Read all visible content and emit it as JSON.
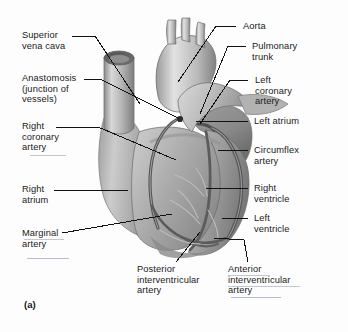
{
  "figure": {
    "panel_letter": "(a)",
    "background_color": "#fdfdfd",
    "ink_color": "#1a1a1a"
  },
  "labels": {
    "left": [
      {
        "id": "superior-vena-cava",
        "lines": [
          "Superior",
          "vena cava"
        ]
      },
      {
        "id": "anastomosis",
        "lines": [
          "Anastomosis",
          "(junction of",
          "vessels)"
        ]
      },
      {
        "id": "right-coronary-artery",
        "lines": [
          "Right",
          "coronary",
          "artery"
        ]
      },
      {
        "id": "right-atrium",
        "lines": [
          "Right",
          "atrium"
        ]
      },
      {
        "id": "marginal-artery",
        "lines": [
          "Marginal",
          "artery"
        ]
      }
    ],
    "right": [
      {
        "id": "aorta",
        "lines": [
          "Aorta"
        ]
      },
      {
        "id": "pulmonary-trunk",
        "lines": [
          "Pulmonary",
          "trunk"
        ]
      },
      {
        "id": "left-coronary-artery",
        "lines": [
          "Left",
          "coronary",
          "artery"
        ]
      },
      {
        "id": "left-atrium",
        "lines": [
          "Left atrium"
        ]
      },
      {
        "id": "circumflex-artery",
        "lines": [
          "Circumflex",
          "artery"
        ]
      },
      {
        "id": "right-ventricle",
        "lines": [
          "Right",
          "ventricle"
        ]
      },
      {
        "id": "left-ventricle",
        "lines": [
          "Left",
          "ventricle"
        ]
      }
    ],
    "bottom": [
      {
        "id": "posterior-interventricular-artery",
        "lines": [
          "Posterior",
          "interventricular",
          "artery"
        ]
      },
      {
        "id": "anterior-interventricular-artery",
        "lines": [
          "Anterior",
          "interventricular",
          "artery"
        ]
      }
    ]
  },
  "text": {
    "superior_vena_cava_l1": "Superior",
    "superior_vena_cava_l2": "vena cava",
    "anastomosis_l1": "Anastomosis",
    "anastomosis_l2": "(junction of",
    "anastomosis_l3": "vessels)",
    "right_coronary_l1": "Right",
    "right_coronary_l2": "coronary",
    "right_coronary_l3": "artery",
    "right_atrium_l1": "Right",
    "right_atrium_l2": "atrium",
    "marginal_l1": "Marginal",
    "marginal_l2": "artery",
    "aorta_l1": "Aorta",
    "pulmonary_l1": "Pulmonary",
    "pulmonary_l2": "trunk",
    "left_coronary_l1": "Left",
    "left_coronary_l2": "coronary",
    "left_coronary_l3": "artery",
    "left_atrium_l1": "Left atrium",
    "circumflex_l1": "Circumflex",
    "circumflex_l2": "artery",
    "right_ventricle_l1": "Right",
    "right_ventricle_l2": "ventricle",
    "left_ventricle_l1": "Left",
    "left_ventricle_l2": "ventricle",
    "post_iv_l1": "Posterior",
    "post_iv_l2": "interventricular",
    "post_iv_l3": "artery",
    "ant_iv_l1": "Anterior",
    "ant_iv_l2": "interventricular",
    "ant_iv_l3": "artery",
    "panel_letter": "(a)"
  },
  "colors": {
    "heart_muscle_light": "#d2d2d2",
    "heart_muscle_mid": "#a8a8a8",
    "heart_muscle_dark": "#7d7d7d",
    "vessel_dark": "#5a5a5a",
    "leader_line": "#1a1a1a",
    "underline_hint": "#b9bec6"
  }
}
